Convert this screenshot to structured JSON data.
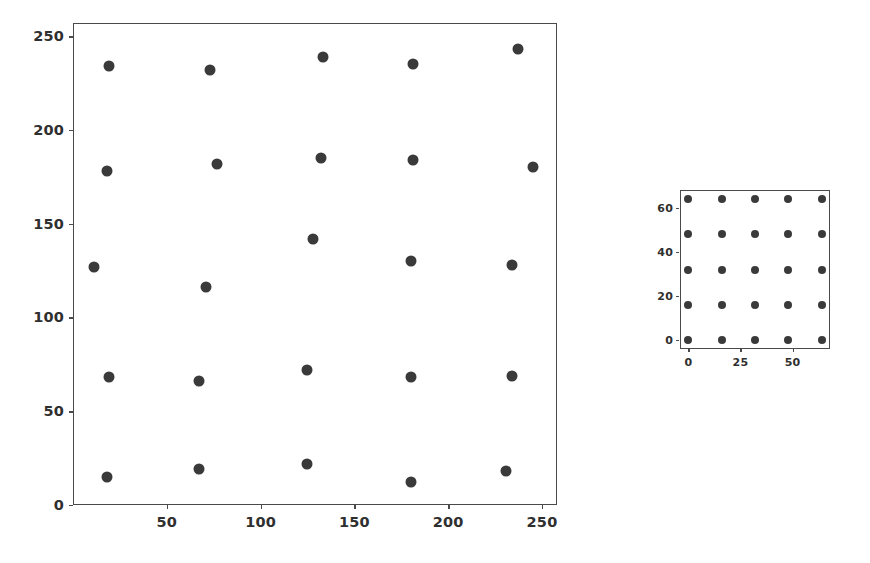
{
  "page": {
    "background_color": "#ffffff",
    "width": 870,
    "height": 563
  },
  "style": {
    "marker_color": "#3a3a3a",
    "axis_color": "#4a4a4a",
    "label_color": "#2f2f2f"
  },
  "chart_data": [
    {
      "id": "distorted-grid-scatter",
      "type": "scatter",
      "title": "",
      "xlabel": "",
      "ylabel": "",
      "xlim": [
        0,
        258
      ],
      "ylim": [
        0,
        257
      ],
      "grid": false,
      "legend": null,
      "marker": "circle",
      "marker_color": "#3a3a3a",
      "xticks": [
        50,
        100,
        150,
        200,
        250
      ],
      "xticklabels": [
        "50",
        "100",
        "150",
        "200",
        "250"
      ],
      "yticks": [
        0,
        50,
        100,
        150,
        200,
        250
      ],
      "yticklabels": [
        "0",
        "50",
        "100",
        "150",
        "200",
        "250"
      ],
      "points": [
        {
          "x": 19,
          "y": 234
        },
        {
          "x": 73,
          "y": 232
        },
        {
          "x": 133,
          "y": 239
        },
        {
          "x": 181,
          "y": 235
        },
        {
          "x": 237,
          "y": 243
        },
        {
          "x": 18,
          "y": 178
        },
        {
          "x": 77,
          "y": 182
        },
        {
          "x": 132,
          "y": 185
        },
        {
          "x": 181,
          "y": 184
        },
        {
          "x": 245,
          "y": 180
        },
        {
          "x": 11,
          "y": 127
        },
        {
          "x": 71,
          "y": 116
        },
        {
          "x": 128,
          "y": 142
        },
        {
          "x": 180,
          "y": 130
        },
        {
          "x": 234,
          "y": 128
        },
        {
          "x": 19,
          "y": 68
        },
        {
          "x": 67,
          "y": 66
        },
        {
          "x": 125,
          "y": 72
        },
        {
          "x": 180,
          "y": 68
        },
        {
          "x": 234,
          "y": 69
        },
        {
          "x": 18,
          "y": 15
        },
        {
          "x": 67,
          "y": 19
        },
        {
          "x": 125,
          "y": 22
        },
        {
          "x": 180,
          "y": 12
        },
        {
          "x": 231,
          "y": 18
        }
      ]
    },
    {
      "id": "regular-grid-scatter",
      "type": "scatter",
      "title": "",
      "xlabel": "",
      "ylabel": "",
      "xlim": [
        -4,
        68
      ],
      "ylim": [
        -4,
        68
      ],
      "grid": false,
      "legend": null,
      "marker": "circle",
      "marker_color": "#3a3a3a",
      "xticks": [
        0,
        25,
        50
      ],
      "xticklabels": [
        "0",
        "25",
        "50"
      ],
      "yticks": [
        0,
        20,
        40,
        60
      ],
      "yticklabels": [
        "0",
        "20",
        "40",
        "60"
      ],
      "points": [
        {
          "x": 0,
          "y": 0
        },
        {
          "x": 16,
          "y": 0
        },
        {
          "x": 32,
          "y": 0
        },
        {
          "x": 48,
          "y": 0
        },
        {
          "x": 64,
          "y": 0
        },
        {
          "x": 0,
          "y": 16
        },
        {
          "x": 16,
          "y": 16
        },
        {
          "x": 32,
          "y": 16
        },
        {
          "x": 48,
          "y": 16
        },
        {
          "x": 64,
          "y": 16
        },
        {
          "x": 0,
          "y": 32
        },
        {
          "x": 16,
          "y": 32
        },
        {
          "x": 32,
          "y": 32
        },
        {
          "x": 48,
          "y": 32
        },
        {
          "x": 64,
          "y": 32
        },
        {
          "x": 0,
          "y": 48
        },
        {
          "x": 16,
          "y": 48
        },
        {
          "x": 32,
          "y": 48
        },
        {
          "x": 48,
          "y": 48
        },
        {
          "x": 64,
          "y": 48
        },
        {
          "x": 0,
          "y": 64
        },
        {
          "x": 16,
          "y": 64
        },
        {
          "x": 32,
          "y": 64
        },
        {
          "x": 48,
          "y": 64
        },
        {
          "x": 64,
          "y": 64
        }
      ]
    }
  ]
}
